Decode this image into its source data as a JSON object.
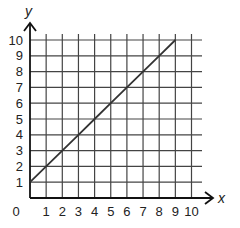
{
  "chart_data": {
    "type": "line",
    "title": "",
    "xlabel": "x",
    "ylabel": "y",
    "xlim": [
      0,
      10
    ],
    "ylim": [
      0,
      10
    ],
    "grid": true,
    "x_ticks": [
      "0",
      "1",
      "2",
      "3",
      "4",
      "5",
      "6",
      "7",
      "8",
      "9",
      "10"
    ],
    "y_ticks": [
      "1",
      "2",
      "3",
      "4",
      "5",
      "6",
      "7",
      "8",
      "9",
      "10"
    ],
    "series": [
      {
        "name": "y = x + 1",
        "x": [
          0,
          1,
          2,
          3,
          4,
          5,
          6,
          7,
          8,
          9
        ],
        "values": [
          1,
          2,
          3,
          4,
          5,
          6,
          7,
          8,
          9,
          10
        ]
      }
    ],
    "colors": {
      "grid": "#444444",
      "axis": "#111111",
      "line": "#333333"
    }
  }
}
